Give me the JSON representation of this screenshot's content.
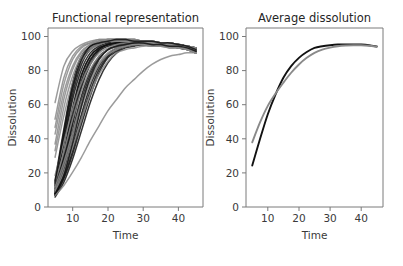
{
  "figure": {
    "width": 403,
    "height": 266,
    "background": "#ffffff"
  },
  "panels": [
    {
      "id": "functional-representation",
      "title": "Functional representation",
      "xlabel": "Time",
      "ylabel": "Dissolution"
    },
    {
      "id": "average-dissolution",
      "title": "Average dissolution",
      "xlabel": "Time",
      "ylabel": "Dissolution"
    }
  ],
  "chart_data": [
    {
      "type": "line",
      "title": "Functional representation",
      "xlabel": "Time",
      "ylabel": "Dissolution",
      "xlim": [
        3.0,
        47.0
      ],
      "ylim": [
        -3.0,
        105.0
      ],
      "xticks": [
        10,
        20,
        30,
        40
      ],
      "yticks": [
        0,
        20,
        40,
        60,
        80,
        100
      ],
      "grid": false,
      "legend": null,
      "colors": {
        "black": "#111111",
        "gray": "#8a8a8a"
      },
      "x": [
        5,
        7.5,
        10,
        12.5,
        15,
        17.5,
        20,
        22.5,
        25,
        27.5,
        30,
        32.5,
        35,
        37.5,
        40,
        42.5,
        45
      ],
      "series": [
        {
          "name": "unit-01",
          "color": "#111111",
          "values": [
            6,
            28,
            55,
            76,
            88,
            93,
            95,
            96,
            96,
            96,
            96,
            95,
            95,
            94,
            94,
            93,
            92
          ]
        },
        {
          "name": "unit-02",
          "color": "#111111",
          "values": [
            4,
            20,
            43,
            64,
            79,
            88,
            92,
            94,
            95,
            95,
            95,
            95,
            94,
            94,
            93,
            92,
            91
          ]
        },
        {
          "name": "unit-03",
          "color": "#111111",
          "values": [
            9,
            35,
            62,
            80,
            90,
            94,
            96,
            97,
            97,
            97,
            97,
            96,
            96,
            95,
            95,
            94,
            93
          ]
        },
        {
          "name": "unit-04",
          "color": "#111111",
          "values": [
            5,
            17,
            34,
            53,
            70,
            82,
            89,
            93,
            94,
            95,
            95,
            95,
            95,
            94,
            94,
            93,
            92
          ]
        },
        {
          "name": "unit-05",
          "color": "#111111",
          "values": [
            11,
            40,
            68,
            85,
            93,
            96,
            97,
            98,
            98,
            97,
            97,
            97,
            96,
            96,
            95,
            94,
            93
          ]
        },
        {
          "name": "unit-06",
          "color": "#111111",
          "values": [
            3,
            12,
            26,
            43,
            60,
            74,
            84,
            90,
            93,
            94,
            95,
            95,
            95,
            94,
            94,
            93,
            92
          ]
        },
        {
          "name": "unit-07",
          "color": "#111111",
          "values": [
            8,
            30,
            57,
            77,
            88,
            93,
            95,
            96,
            96,
            96,
            96,
            96,
            95,
            95,
            94,
            93,
            92
          ]
        },
        {
          "name": "unit-08",
          "color": "#111111",
          "values": [
            5,
            22,
            47,
            69,
            83,
            91,
            94,
            95,
            96,
            96,
            96,
            95,
            95,
            94,
            94,
            93,
            91
          ]
        },
        {
          "name": "unit-09",
          "color": "#111111",
          "values": [
            13,
            44,
            72,
            88,
            94,
            97,
            98,
            98,
            98,
            98,
            97,
            97,
            96,
            96,
            95,
            94,
            93
          ]
        },
        {
          "name": "unit-10",
          "color": "#111111",
          "values": [
            4,
            15,
            31,
            50,
            67,
            80,
            88,
            92,
            94,
            95,
            95,
            95,
            94,
            94,
            93,
            92,
            90
          ]
        },
        {
          "name": "unit-11",
          "color": "#111111",
          "values": [
            7,
            26,
            52,
            73,
            86,
            92,
            95,
            96,
            96,
            96,
            96,
            96,
            95,
            95,
            94,
            93,
            92
          ]
        },
        {
          "name": "unit-12",
          "color": "#111111",
          "values": [
            6,
            24,
            49,
            71,
            85,
            92,
            95,
            96,
            96,
            96,
            96,
            95,
            95,
            94,
            94,
            93,
            91
          ]
        },
        {
          "name": "unit-13",
          "color": "#111111",
          "values": [
            10,
            37,
            65,
            83,
            92,
            95,
            97,
            97,
            97,
            97,
            97,
            96,
            96,
            95,
            95,
            94,
            93
          ]
        },
        {
          "name": "unit-14",
          "color": "#111111",
          "values": [
            4,
            14,
            29,
            47,
            64,
            78,
            87,
            91,
            94,
            95,
            95,
            95,
            94,
            94,
            93,
            92,
            90
          ]
        },
        {
          "name": "unit-15",
          "color": "#111111",
          "values": [
            5,
            19,
            40,
            61,
            77,
            87,
            92,
            94,
            95,
            96,
            96,
            95,
            95,
            94,
            94,
            93,
            91
          ]
        },
        {
          "name": "unit-16",
          "color": "#8a8a8a",
          "values": [
            35,
            62,
            80,
            90,
            95,
            97,
            98,
            98,
            98,
            98,
            97,
            97,
            96,
            96,
            95,
            94,
            93
          ]
        },
        {
          "name": "unit-17",
          "color": "#8a8a8a",
          "values": [
            27,
            52,
            72,
            85,
            92,
            95,
            97,
            97,
            97,
            97,
            97,
            96,
            96,
            95,
            95,
            94,
            92
          ]
        },
        {
          "name": "unit-18",
          "color": "#8a8a8a",
          "values": [
            45,
            71,
            86,
            93,
            96,
            98,
            98,
            98,
            98,
            98,
            97,
            97,
            96,
            96,
            95,
            94,
            93
          ]
        },
        {
          "name": "unit-19",
          "color": "#8a8a8a",
          "values": [
            60,
            82,
            91,
            95,
            97,
            98,
            98,
            98,
            98,
            98,
            97,
            97,
            96,
            95,
            95,
            94,
            93
          ]
        },
        {
          "name": "unit-20",
          "color": "#8a8a8a",
          "values": [
            16,
            36,
            56,
            72,
            83,
            90,
            93,
            95,
            96,
            96,
            96,
            95,
            95,
            94,
            94,
            93,
            91
          ]
        },
        {
          "name": "unit-21",
          "color": "#8a8a8a",
          "values": [
            9,
            24,
            42,
            60,
            74,
            84,
            90,
            93,
            94,
            95,
            95,
            95,
            94,
            94,
            93,
            92,
            90
          ]
        },
        {
          "name": "unit-22",
          "color": "#8a8a8a",
          "values": [
            41,
            66,
            82,
            91,
            95,
            97,
            97,
            98,
            98,
            97,
            97,
            96,
            96,
            95,
            95,
            94,
            93
          ]
        },
        {
          "name": "unit-23",
          "color": "#8a8a8a",
          "values": [
            6,
            18,
            33,
            50,
            65,
            77,
            85,
            90,
            92,
            93,
            94,
            94,
            94,
            93,
            93,
            92,
            90
          ]
        },
        {
          "name": "unit-24-slow",
          "color": "#8a8a8a",
          "values": [
            4,
            10,
            18,
            27,
            37,
            46,
            55,
            62,
            69,
            74,
            79,
            83,
            86,
            88,
            89,
            90,
            90
          ]
        },
        {
          "name": "unit-25",
          "color": "#8a8a8a",
          "values": [
            31,
            57,
            76,
            88,
            93,
            96,
            97,
            97,
            97,
            97,
            96,
            96,
            95,
            95,
            94,
            93,
            92
          ]
        },
        {
          "name": "unit-26",
          "color": "#8a8a8a",
          "values": [
            12,
            30,
            50,
            67,
            80,
            88,
            92,
            94,
            95,
            95,
            95,
            95,
            94,
            94,
            93,
            92,
            90
          ]
        },
        {
          "name": "unit-27",
          "color": "#8a8a8a",
          "values": [
            50,
            75,
            88,
            94,
            96,
            97,
            98,
            98,
            98,
            97,
            97,
            96,
            96,
            95,
            94,
            93,
            92
          ]
        },
        {
          "name": "unit-28",
          "color": "#8a8a8a",
          "values": [
            7,
            21,
            39,
            57,
            72,
            83,
            89,
            92,
            94,
            95,
            95,
            94,
            94,
            93,
            93,
            92,
            90
          ]
        },
        {
          "name": "unit-29",
          "color": "#111111",
          "values": [
            5,
            16,
            36,
            58,
            75,
            86,
            92,
            94,
            95,
            96,
            96,
            95,
            95,
            94,
            94,
            93,
            91
          ]
        },
        {
          "name": "unit-30",
          "color": "#111111",
          "values": [
            12,
            42,
            70,
            86,
            94,
            96,
            97,
            98,
            98,
            97,
            97,
            97,
            96,
            96,
            95,
            94,
            92
          ]
        }
      ]
    },
    {
      "type": "line",
      "title": "Average dissolution",
      "xlabel": "Time",
      "ylabel": "Dissolution",
      "xlim": [
        3.0,
        47.0
      ],
      "ylim": [
        -3.0,
        105.0
      ],
      "xticks": [
        10,
        20,
        30,
        40
      ],
      "yticks": [
        0,
        20,
        40,
        60,
        80,
        100
      ],
      "grid": false,
      "legend": null,
      "colors": {
        "black": "#111111",
        "gray": "#8a8a8a"
      },
      "x": [
        5,
        7.5,
        10,
        12.5,
        15,
        17.5,
        20,
        22.5,
        25,
        27.5,
        30,
        32.5,
        35,
        37.5,
        40,
        42.5,
        45
      ],
      "series": [
        {
          "name": "mean-black",
          "color": "#111111",
          "values": [
            22,
            38,
            53,
            65,
            75,
            82,
            87,
            90.5,
            93,
            94,
            94.6,
            95,
            95.1,
            95.1,
            95,
            94.6,
            93.8
          ]
        },
        {
          "name": "mean-gray",
          "color": "#8a8a8a",
          "values": [
            36,
            48,
            58,
            65.5,
            72,
            78,
            83,
            87,
            90,
            92,
            93.2,
            94,
            94.4,
            94.6,
            94.6,
            94.3,
            93.7
          ]
        }
      ]
    }
  ]
}
